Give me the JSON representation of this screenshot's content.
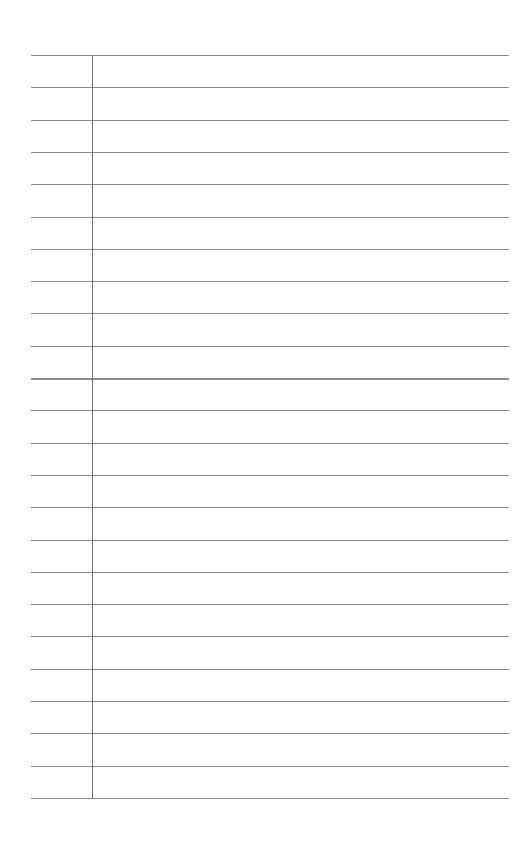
{
  "document": {
    "type": "lined-paper",
    "background_color": "#ffffff",
    "line_color": "#8c8c8c",
    "margin_line_color": "#6f6f6f",
    "line_count": 24,
    "first_line_y": 55,
    "line_spacing": 32.3,
    "line_left_x": 31,
    "line_right_x": 509,
    "margin_x": 92,
    "emphasized_line_index": 10
  }
}
